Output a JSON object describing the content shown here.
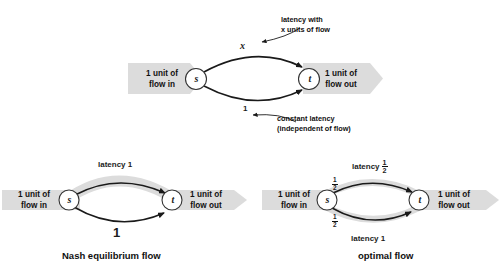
{
  "figure": {
    "title_semantics": "Pigou's example: Nash equilibrium flow versus optimal flow on a two-link network",
    "colors": {
      "flow_band": "#dcdcdc",
      "edge_stroke": "#1a1a1a",
      "node_stroke": "#333333",
      "node_fill": "#ffffff",
      "text": "#111111"
    }
  },
  "top_diagram": {
    "inflow_label": "1 unit of\nflow in",
    "inflow_line1": "1 unit of",
    "inflow_line2": "flow in",
    "outflow_line1": "1 unit of",
    "outflow_line2": "flow out",
    "source_node": "s",
    "sink_node": "t",
    "upper_edge_label": "x",
    "lower_edge_label": "1",
    "upper_annotation_line1": "latency with",
    "upper_annotation_line2": "x units of flow",
    "lower_annotation_line1": "constant latency",
    "lower_annotation_line2": "(independent of flow)"
  },
  "nash_diagram": {
    "caption": "Nash equilibrium flow",
    "inflow_line1": "1 unit of",
    "inflow_line2": "flow in",
    "outflow_line1": "1 unit of",
    "outflow_line2": "flow out",
    "source_node": "s",
    "sink_node": "t",
    "upper_edge_label": "latency 1",
    "lower_edge_label": "1",
    "upper_flow_amount": "1",
    "lower_flow_amount": "0"
  },
  "optimal_diagram": {
    "caption": "optimal flow",
    "inflow_line1": "1 unit of",
    "inflow_line2": "flow in",
    "outflow_line1": "1 unit of",
    "outflow_line2": "flow out",
    "source_node": "s",
    "sink_node": "t",
    "upper_latency_prefix": "latency",
    "upper_latency_fraction_num": "1",
    "upper_latency_fraction_den": "2",
    "lower_latency_label": "latency  1",
    "upper_flow_num": "1",
    "upper_flow_den": "2",
    "lower_flow_num": "1",
    "lower_flow_den": "2"
  }
}
